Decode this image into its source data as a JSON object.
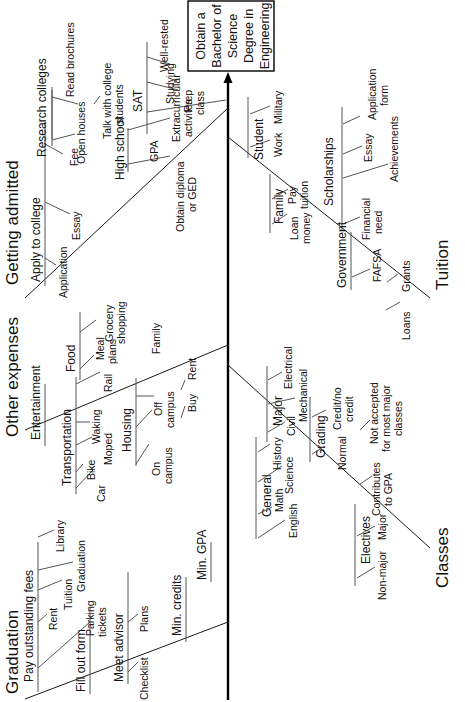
{
  "diagram": {
    "type": "fishbone",
    "orientation": "rotated-90-ccw",
    "goal": {
      "lines": [
        "Obtain a",
        "Bachelor of",
        "Science",
        "Degree in",
        "Engineering"
      ]
    },
    "categories": [
      {
        "name": "Getting admitted",
        "side": "top",
        "causes": [
          {
            "name": "Research colleges",
            "subcauses": [
              "Read brochures",
              "Open houses",
              "Talk with college students"
            ]
          },
          {
            "name": "SAT",
            "subcauses": [
              "Well-rested",
              "Studying",
              "Prep class"
            ]
          },
          {
            "name": "Apply to college",
            "subcauses": [
              "Application",
              "Essay",
              "Fee"
            ]
          },
          {
            "name": "High school",
            "subcauses": [
              "Obtain diploma or GED",
              "GPA",
              "Extracurricular activities"
            ]
          }
        ]
      },
      {
        "name": "Other expenses",
        "side": "top",
        "causes": [
          {
            "name": "Food",
            "subcauses": [
              "Meal plans",
              "Grocery shopping"
            ]
          },
          {
            "name": "Entertainment",
            "subcauses": []
          },
          {
            "name": "Transportation",
            "subcauses": [
              "Car",
              "Bike",
              "Moped",
              "Walking",
              "Rail"
            ]
          },
          {
            "name": "Housing",
            "subcauses": [
              "On campus",
              "Off campus",
              "Family"
            ],
            "off_campus": [
              "Buy",
              "Rent"
            ]
          }
        ]
      },
      {
        "name": "Graduation",
        "side": "top",
        "causes": [
          {
            "name": "Pay outstanding fees",
            "subcauses": [
              "Parking tickets",
              "Rent",
              "Tuition",
              "Graduation",
              "Library"
            ]
          },
          {
            "name": "Fill out form",
            "subcauses": []
          },
          {
            "name": "Meet advisor",
            "subcauses": [
              "Checklist",
              "Plans"
            ]
          },
          {
            "name": "Min. credits",
            "subcauses": []
          },
          {
            "name": "Min. GPA",
            "subcauses": []
          }
        ]
      },
      {
        "name": "Tuition",
        "side": "bottom",
        "causes": [
          {
            "name": "Student",
            "subcauses": [
              "Work",
              "Military"
            ]
          },
          {
            "name": "Family",
            "subcauses": [
              "Loan money",
              "Pay tuition"
            ]
          },
          {
            "name": "Scholarships",
            "subcauses": [
              "Financial need",
              "Achievements",
              "Essay",
              "Application form"
            ]
          },
          {
            "name": "Government",
            "subcauses": [
              "Loans",
              "FAFSA",
              "Grants"
            ]
          }
        ]
      },
      {
        "name": "Classes",
        "side": "bottom",
        "causes": [
          {
            "name": "Major",
            "subcauses": [
              "Civil",
              "Mechanical",
              "Electrical"
            ]
          },
          {
            "name": "General",
            "subcauses": [
              "English",
              "Math",
              "Science",
              "History"
            ]
          },
          {
            "name": "Grading",
            "subcauses": [
              "Normal",
              "Credit/no credit"
            ],
            "notes": [
              "Contributes to GPA",
              "Not accepted for most major classes"
            ]
          },
          {
            "name": "Electives",
            "subcauses": [
              "Non-major",
              "Major"
            ]
          }
        ]
      }
    ]
  },
  "labels": {
    "getting_admitted": "Getting admitted",
    "other_expenses": "Other expenses",
    "graduation": "Graduation",
    "tuition": "Tuition",
    "classes": "Classes",
    "research_colleges": "Research colleges",
    "read_brochures": "Read brochures",
    "open_houses": "Open houses",
    "talk_with_1": "Talk with college",
    "talk_with_2": "students",
    "sat": "SAT",
    "well_rested": "Well-rested",
    "studying": "Studying",
    "prep_1": "Prep",
    "prep_2": "class",
    "apply_to_college": "Apply to college",
    "application": "Application",
    "essay": "Essay",
    "fee": "Fee",
    "high_school": "High school",
    "obtain_1": "Obtain diploma",
    "obtain_2": "or GED",
    "gpa": "GPA",
    "extra_1": "Extracurricular",
    "extra_2": "activites",
    "food": "Food",
    "meal_1": "Meal",
    "meal_2": "plans",
    "grocery_1": "Grocery",
    "grocery_2": "shopping",
    "entertainment": "Entertainment",
    "transportation": "Transportation",
    "car": "Car",
    "bike": "Bike",
    "moped": "Moped",
    "walking": "Waking",
    "rail": "Rail",
    "housing": "Housing",
    "on_1": "On",
    "on_2": "campus",
    "off_1": "Off",
    "off_2": "campus",
    "family_h": "Family",
    "buy": "Buy",
    "rent_h": "Rent",
    "pay_fees": "Pay outstanding fees",
    "rent_g": "Rent",
    "tuition_g": "Tuition",
    "graduation_g": "Graduation",
    "library": "Library",
    "parking_1": "Parking",
    "parking_2": "tickets",
    "fill_out_form": "Fill out form",
    "meet_advisor": "Meet advisor",
    "checklist": "Checklist",
    "plans": "Plans",
    "min_credits": "Min. credits",
    "min_gpa": "Min. GPA",
    "student": "Student",
    "work": "Work",
    "military": "Military",
    "family_t": "Family",
    "loan_1": "Loan",
    "loan_2": "money",
    "pay_1": "Pay",
    "pay_2": "tuition",
    "scholarships": "Scholarships",
    "fin_1": "Financial",
    "fin_2": "need",
    "achievements": "Achievements",
    "essay_s": "Essay",
    "appform_1": "Application",
    "appform_2": "form",
    "government": "Government",
    "loans": "Loans",
    "fafsa": "FAFSA",
    "grants": "Grants",
    "major": "Major",
    "civil": "Civil",
    "mechanical": "Mechanical",
    "electrical": "Electrical",
    "general": "General",
    "english": "English",
    "math": "Math",
    "science": "Science",
    "history": "History",
    "grading": "Grading",
    "normal": "Normal",
    "credit_1": "Credit/no",
    "credit_2": "credit",
    "contrib_1": "Contributes",
    "contrib_2": "to GPA",
    "notacc_1": "Not accepted",
    "notacc_2": "for most major",
    "notacc_3": "classes",
    "electives": "Electives",
    "nonmajor": "Non-major",
    "major_e": "Major"
  }
}
